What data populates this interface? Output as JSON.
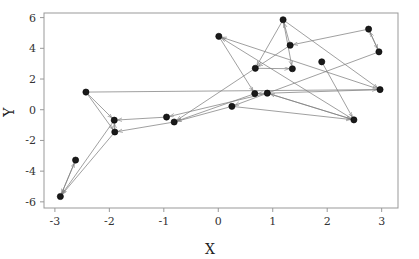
{
  "chart_data": {
    "type": "scatter",
    "title": "",
    "xlabel": "X",
    "ylabel": "Y",
    "xlim": [
      -3.2,
      3.3
    ],
    "ylim": [
      -6.4,
      6.3
    ],
    "xticks": [
      -3,
      -2,
      -1,
      0,
      1,
      2,
      3
    ],
    "xticklabels": [
      "-3",
      "-2",
      "-1",
      "0",
      "1",
      "2",
      "3"
    ],
    "yticks": [
      -6,
      -4,
      -2,
      0,
      2,
      4,
      6
    ],
    "yticklabels": [
      "-6",
      "-4",
      "-2",
      "0",
      "2",
      "4",
      "6"
    ],
    "grid": false,
    "legend": null,
    "marker_color": "#1a1a1a",
    "arrow_color": "#808080",
    "axis_color": "#999999",
    "points": [
      {
        "id": 0,
        "x": -2.9,
        "y": -5.65
      },
      {
        "id": 1,
        "x": -2.62,
        "y": -3.28
      },
      {
        "id": 2,
        "x": -2.43,
        "y": 1.15
      },
      {
        "id": 3,
        "x": -1.91,
        "y": -0.68
      },
      {
        "id": 4,
        "x": -1.9,
        "y": -1.45
      },
      {
        "id": 5,
        "x": -0.95,
        "y": -0.48
      },
      {
        "id": 6,
        "x": -0.81,
        "y": -0.8
      },
      {
        "id": 7,
        "x": 0.01,
        "y": 4.78
      },
      {
        "id": 8,
        "x": 0.25,
        "y": 0.22
      },
      {
        "id": 9,
        "x": 0.68,
        "y": 2.7
      },
      {
        "id": 10,
        "x": 0.67,
        "y": 1.05
      },
      {
        "id": 11,
        "x": 0.9,
        "y": 1.08
      },
      {
        "id": 12,
        "x": 1.19,
        "y": 5.86
      },
      {
        "id": 13,
        "x": 1.32,
        "y": 4.2
      },
      {
        "id": 14,
        "x": 1.36,
        "y": 2.67
      },
      {
        "id": 15,
        "x": 1.9,
        "y": 3.12
      },
      {
        "id": 16,
        "x": 2.49,
        "y": -0.66
      },
      {
        "id": 17,
        "x": 2.76,
        "y": 5.25
      },
      {
        "id": 18,
        "x": 2.95,
        "y": 3.77
      },
      {
        "id": 19,
        "x": 2.97,
        "y": 1.31
      }
    ],
    "arrows": [
      {
        "from": 2,
        "to": 4
      },
      {
        "from": 4,
        "to": 0
      },
      {
        "from": 3,
        "to": 0
      },
      {
        "from": 1,
        "to": 0
      },
      {
        "from": 0,
        "to": 1
      },
      {
        "from": 4,
        "to": 3
      },
      {
        "from": 6,
        "to": 4
      },
      {
        "from": 5,
        "to": 3
      },
      {
        "from": 8,
        "to": 6
      },
      {
        "from": 9,
        "to": 6
      },
      {
        "from": 10,
        "to": 6
      },
      {
        "from": 11,
        "to": 5
      },
      {
        "from": 7,
        "to": 10
      },
      {
        "from": 12,
        "to": 9
      },
      {
        "from": 13,
        "to": 9
      },
      {
        "from": 9,
        "to": 14
      },
      {
        "from": 12,
        "to": 14
      },
      {
        "from": 17,
        "to": 13
      },
      {
        "from": 18,
        "to": 17
      },
      {
        "from": 17,
        "to": 18
      },
      {
        "from": 19,
        "to": 7
      },
      {
        "from": 16,
        "to": 7
      },
      {
        "from": 19,
        "to": 10
      },
      {
        "from": 16,
        "to": 11
      },
      {
        "from": 12,
        "to": 19
      },
      {
        "from": 18,
        "to": 8
      },
      {
        "from": 2,
        "to": 19
      },
      {
        "from": 15,
        "to": 16
      },
      {
        "from": 11,
        "to": 16
      },
      {
        "from": 13,
        "to": 12
      },
      {
        "from": 2,
        "to": 3
      },
      {
        "from": 8,
        "to": 16
      }
    ]
  }
}
